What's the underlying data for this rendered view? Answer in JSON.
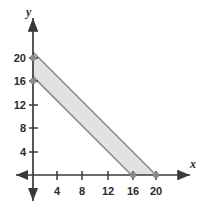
{
  "figure": {
    "background_color": "#ffffff",
    "axis_color": "#3a3a3a",
    "line_color": "#8a8a8a",
    "fill_color": "#e2e2e2",
    "marker_color": "#8a8a8a",
    "text_color": "#2b2b2b"
  },
  "axes": {
    "x_label": "x",
    "y_label": "y",
    "x_ticks": [
      {
        "value": 4,
        "label": "4"
      },
      {
        "value": 8,
        "label": "8"
      },
      {
        "value": 12,
        "label": "12"
      },
      {
        "value": 16,
        "label": "16"
      },
      {
        "value": 20,
        "label": "20"
      }
    ],
    "y_ticks": [
      {
        "value": 4,
        "label": "4"
      },
      {
        "value": 8,
        "label": "8"
      },
      {
        "value": 12,
        "label": "12"
      },
      {
        "value": 16,
        "label": "16"
      },
      {
        "value": 20,
        "label": "20"
      }
    ]
  },
  "chart_data": {
    "type": "area",
    "title": "",
    "xlabel": "x",
    "ylabel": "y",
    "xlim": [
      0,
      23
    ],
    "ylim": [
      0,
      23
    ],
    "grid": false,
    "legend": "none",
    "x_ticks": [
      4,
      8,
      12,
      16,
      20
    ],
    "y_ticks": [
      4,
      8,
      12,
      16,
      20
    ],
    "x_tick_labels": [
      "4",
      "8",
      "12",
      "16",
      "20"
    ],
    "y_tick_labels": [
      "4",
      "8",
      "12",
      "16",
      "20"
    ],
    "series": [
      {
        "name": "upper boundary",
        "equation": "x + y = 20",
        "points": [
          [
            0,
            20
          ],
          [
            20,
            0
          ]
        ]
      },
      {
        "name": "lower boundary",
        "equation": "x + y = 16",
        "points": [
          [
            0,
            16
          ],
          [
            16,
            0
          ]
        ]
      }
    ],
    "shaded_region": {
      "fill": "#e2e2e2",
      "vertices": [
        [
          0,
          20
        ],
        [
          20,
          0
        ],
        [
          16,
          0
        ],
        [
          0,
          16
        ]
      ]
    },
    "markers": [
      {
        "x": 0,
        "y": 20
      },
      {
        "x": 0,
        "y": 16
      },
      {
        "x": 16,
        "y": 0
      },
      {
        "x": 20,
        "y": 0
      }
    ]
  }
}
